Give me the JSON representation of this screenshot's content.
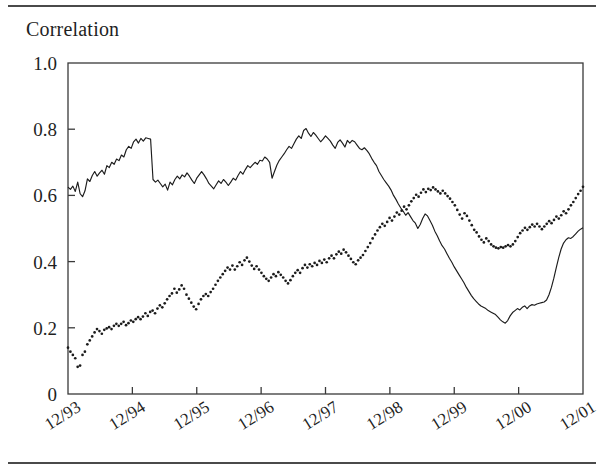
{
  "figure": {
    "title": "Correlation",
    "top_rule": true,
    "bottom_rule": true
  },
  "chart_data": {
    "type": "line",
    "title": "Correlation",
    "xlabel": "",
    "ylabel": "Correlation",
    "ylim": [
      0,
      1.0
    ],
    "yticks": [
      0,
      0.2,
      0.4,
      0.6,
      0.8,
      1.0
    ],
    "ytick_labels": [
      "0",
      "0.2",
      "0.4",
      "0.6",
      "0.8",
      "1.0"
    ],
    "xticks": [
      "12/93",
      "12/94",
      "12/95",
      "12/96",
      "12/97",
      "12/98",
      "12/99",
      "12/00",
      "12/01"
    ],
    "xtick_labels": [
      "12/93",
      "12/94",
      "12/95",
      "12/96",
      "12/97",
      "12/98",
      "12/99",
      "12/00",
      "12/01"
    ],
    "xtick_rotation_deg": 32,
    "grid": false,
    "legend_position": "inline-annotation",
    "annotations": [
      {
        "text": "Country",
        "x": "1996-06",
        "y": 0.83
      },
      {
        "text": "Industry",
        "x": "1997-09",
        "y": 0.44
      }
    ],
    "x_range": [
      "12/93",
      "12/01"
    ],
    "series": [
      {
        "name": "Country",
        "style": "solid-line",
        "color": "#1c1c1c",
        "values": [
          0.625,
          0.618,
          0.628,
          0.612,
          0.64,
          0.605,
          0.596,
          0.614,
          0.65,
          0.642,
          0.66,
          0.672,
          0.658,
          0.668,
          0.676,
          0.664,
          0.69,
          0.684,
          0.7,
          0.694,
          0.71,
          0.705,
          0.722,
          0.716,
          0.738,
          0.748,
          0.742,
          0.762,
          0.77,
          0.758,
          0.772,
          0.764,
          0.774,
          0.772,
          0.77,
          0.648,
          0.64,
          0.646,
          0.636,
          0.626,
          0.634,
          0.616,
          0.64,
          0.632,
          0.648,
          0.658,
          0.65,
          0.662,
          0.656,
          0.668,
          0.658,
          0.646,
          0.636,
          0.652,
          0.662,
          0.672,
          0.662,
          0.65,
          0.636,
          0.628,
          0.62,
          0.632,
          0.644,
          0.636,
          0.648,
          0.64,
          0.63,
          0.64,
          0.652,
          0.646,
          0.66,
          0.672,
          0.664,
          0.678,
          0.69,
          0.684,
          0.692,
          0.7,
          0.694,
          0.706,
          0.704,
          0.716,
          0.71,
          0.7,
          0.652,
          0.672,
          0.692,
          0.706,
          0.716,
          0.726,
          0.738,
          0.748,
          0.742,
          0.756,
          0.77,
          0.78,
          0.772,
          0.796,
          0.802,
          0.788,
          0.778,
          0.79,
          0.782,
          0.772,
          0.762,
          0.77,
          0.78,
          0.772,
          0.764,
          0.752,
          0.742,
          0.76,
          0.768,
          0.758,
          0.746,
          0.766,
          0.758,
          0.766,
          0.762,
          0.752,
          0.742,
          0.738,
          0.744,
          0.736,
          0.726,
          0.712,
          0.7,
          0.69,
          0.672,
          0.66,
          0.648,
          0.638,
          0.628,
          0.616,
          0.6,
          0.588,
          0.574,
          0.562,
          0.552,
          0.54,
          0.548,
          0.536,
          0.524,
          0.516,
          0.5,
          0.512,
          0.53,
          0.544,
          0.538,
          0.524,
          0.51,
          0.492,
          0.478,
          0.462,
          0.448,
          0.438,
          0.424,
          0.41,
          0.398,
          0.384,
          0.372,
          0.36,
          0.348,
          0.336,
          0.322,
          0.31,
          0.298,
          0.288,
          0.28,
          0.272,
          0.266,
          0.262,
          0.258,
          0.252,
          0.248,
          0.244,
          0.24,
          0.232,
          0.224,
          0.218,
          0.214,
          0.222,
          0.236,
          0.246,
          0.252,
          0.258,
          0.254,
          0.262,
          0.266,
          0.258,
          0.266,
          0.27,
          0.268,
          0.272,
          0.274,
          0.276,
          0.278,
          0.284,
          0.3,
          0.322,
          0.35,
          0.382,
          0.412,
          0.438,
          0.456,
          0.466,
          0.472,
          0.47,
          0.476,
          0.484,
          0.492,
          0.498,
          0.502
        ]
      },
      {
        "name": "Industry",
        "style": "dotted",
        "color": "#1c1c1c",
        "values": [
          0.14,
          0.128,
          0.118,
          0.108,
          0.082,
          0.086,
          0.118,
          0.128,
          0.15,
          0.162,
          0.174,
          0.186,
          0.196,
          0.19,
          0.182,
          0.194,
          0.198,
          0.202,
          0.196,
          0.206,
          0.212,
          0.206,
          0.212,
          0.218,
          0.208,
          0.214,
          0.222,
          0.218,
          0.226,
          0.232,
          0.226,
          0.234,
          0.244,
          0.236,
          0.248,
          0.252,
          0.244,
          0.258,
          0.268,
          0.262,
          0.274,
          0.286,
          0.296,
          0.304,
          0.318,
          0.306,
          0.316,
          0.328,
          0.318,
          0.3,
          0.288,
          0.276,
          0.264,
          0.256,
          0.272,
          0.286,
          0.296,
          0.302,
          0.296,
          0.308,
          0.318,
          0.33,
          0.342,
          0.352,
          0.362,
          0.372,
          0.382,
          0.376,
          0.388,
          0.376,
          0.386,
          0.398,
          0.39,
          0.404,
          0.412,
          0.4,
          0.388,
          0.378,
          0.386,
          0.376,
          0.366,
          0.356,
          0.348,
          0.342,
          0.352,
          0.362,
          0.356,
          0.368,
          0.36,
          0.352,
          0.342,
          0.334,
          0.344,
          0.356,
          0.366,
          0.374,
          0.366,
          0.38,
          0.39,
          0.382,
          0.392,
          0.386,
          0.396,
          0.39,
          0.402,
          0.396,
          0.406,
          0.398,
          0.41,
          0.418,
          0.41,
          0.422,
          0.43,
          0.424,
          0.436,
          0.428,
          0.418,
          0.408,
          0.398,
          0.392,
          0.404,
          0.412,
          0.42,
          0.432,
          0.444,
          0.456,
          0.47,
          0.482,
          0.494,
          0.504,
          0.514,
          0.508,
          0.52,
          0.532,
          0.524,
          0.536,
          0.548,
          0.542,
          0.554,
          0.566,
          0.558,
          0.57,
          0.582,
          0.592,
          0.602,
          0.596,
          0.608,
          0.618,
          0.61,
          0.62,
          0.616,
          0.624,
          0.618,
          0.612,
          0.606,
          0.614,
          0.606,
          0.598,
          0.59,
          0.58,
          0.57,
          0.556,
          0.542,
          0.53,
          0.546,
          0.538,
          0.524,
          0.51,
          0.496,
          0.488,
          0.476,
          0.466,
          0.458,
          0.47,
          0.462,
          0.452,
          0.446,
          0.442,
          0.44,
          0.444,
          0.442,
          0.446,
          0.45,
          0.446,
          0.452,
          0.462,
          0.474,
          0.486,
          0.494,
          0.502,
          0.496,
          0.504,
          0.512,
          0.506,
          0.514,
          0.506,
          0.498,
          0.506,
          0.514,
          0.522,
          0.516,
          0.526,
          0.536,
          0.53,
          0.54,
          0.552,
          0.546,
          0.558,
          0.57,
          0.58,
          0.592,
          0.604,
          0.614,
          0.626
        ]
      }
    ]
  }
}
